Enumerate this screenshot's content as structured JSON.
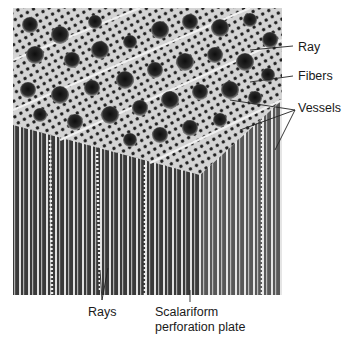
{
  "figure": {
    "type": "scanning electron micrograph of hardwood block",
    "colors": {
      "background": "#ffffff",
      "label_text": "#1a1a1a",
      "leader_line": "#222222",
      "cell_wall": "#d8d8d8",
      "lumen": "#1c1c1c"
    }
  },
  "labels": {
    "ray": "Ray",
    "fibers": "Fibers",
    "vessels": "Vessels",
    "rays": "Rays",
    "scalariform_line1": "Scalariform",
    "scalariform_line2": "perforation plate"
  }
}
